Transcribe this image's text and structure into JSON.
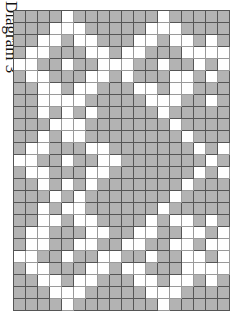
{
  "title": "Diagram 3",
  "colors": {
    "filled": "#b3b3b3",
    "empty": "#ffffff",
    "gridline": "#555555"
  },
  "grid": {
    "columns": 18,
    "legend": {
      "G": "filled (gray)",
      "W": "empty (white)"
    },
    "rows": [
      "GGGGWGGGGGGGWGGGGG",
      "GGGWWWGGGGGWWWGGGG",
      "GGWWGWWGGGWWGWWGWG",
      "GWWGGGWWGWWGGGWWWW",
      "WWGGWGGWWWGGWGGWGW",
      "GWWGGGWWGWGGGWWGWG",
      "GGWWGWWGGGWWGWWGGG",
      "GGWWWWGGGGGWWWGGWG",
      "GGWGWGWGGGGGWGGGGG",
      "GGGWWWGGGGGGGWGGGG",
      "GGWGWWGGGGGGGGWGGG",
      "GWWGGGWWGGGGGGGWGW",
      "WWGGWGGWWGGGGGGGWG",
      "GWWGGGWWGGGGGGGWGW",
      "GGWGWGWGGGGGGGWGGG",
      "GGGWGWGGGGGGGWGGGG",
      "GGWGWWGGGGGGWGGGGG",
      "GGWWGWWGGGGWGWWGWG",
      "GWWGGGWWGGWWGGWWGW",
      "GWWGGWWGGWWGGWWGWW",
      "WWGGWGGWWGGWGGWWGW",
      "GWWGGGWWGWWGGGWWWW",
      "GGWWGWWGGGWWGWWGWG",
      "GGGWWWGGGGGWWWGGGG",
      "GGGGWGGGGGGGWGGGGG"
    ]
  }
}
